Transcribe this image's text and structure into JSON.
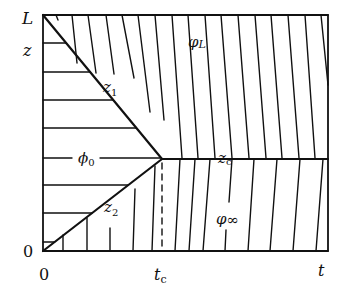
{
  "diagram": {
    "stroke_color": "#111111",
    "background": "#ffffff",
    "frame": {
      "x0": 43,
      "y0": 15,
      "x1": 328,
      "y1": 251
    },
    "junction": {
      "x": 162,
      "y": 159
    },
    "labels": {
      "L": "L",
      "z": "z",
      "z1": "z",
      "z1_sub": "1",
      "z2": "z",
      "z2_sub": "2",
      "zc": "z",
      "zc_sub": "c",
      "phi0": "ϕ",
      "phi0_sub": "0",
      "phiL": "φ",
      "phiL_sub": "L",
      "phiInf": "φ",
      "phiInf_sub": "∞",
      "origin_z": "0",
      "origin_t": "0",
      "tc": "t",
      "tc_sub": "c",
      "t": "t"
    },
    "left_top_hlines_y": [
      43,
      72,
      100,
      128
    ],
    "phi0_line_y": 158,
    "left_bottom_hlines_y": [
      185,
      213,
      242
    ],
    "top_region_lines": [
      [
        56,
        15,
        58,
        20
      ],
      [
        72,
        15,
        77,
        63
      ],
      [
        88,
        15,
        96,
        73
      ],
      [
        106,
        15,
        114,
        74
      ],
      [
        122,
        15,
        134,
        78
      ],
      [
        138,
        15,
        150,
        112
      ],
      [
        155,
        15,
        164,
        120
      ],
      [
        172,
        15,
        182,
        158
      ],
      [
        188,
        15,
        198,
        158
      ],
      [
        205,
        15,
        215,
        158
      ],
      [
        221,
        15,
        232,
        158
      ],
      [
        238,
        15,
        249,
        158
      ],
      [
        255,
        15,
        266,
        158
      ],
      [
        271,
        15,
        282,
        158
      ],
      [
        288,
        15,
        299,
        158
      ],
      [
        305,
        15,
        315,
        158
      ],
      [
        321,
        15,
        328,
        85
      ]
    ],
    "bottom_region_lines": [
      [
        180,
        159,
        175,
        251
      ],
      [
        195,
        159,
        189,
        251
      ],
      [
        210,
        159,
        203,
        251
      ],
      [
        254,
        159,
        248,
        251
      ],
      [
        277,
        159,
        270,
        251
      ],
      [
        300,
        159,
        293,
        251
      ],
      [
        323,
        159,
        316,
        251
      ]
    ],
    "lower_left_vlines": [
      [
        63,
        235,
        63,
        251
      ],
      [
        87,
        218,
        87,
        251
      ],
      [
        110,
        228,
        110,
        251
      ],
      [
        135,
        189,
        133,
        251
      ],
      [
        155,
        166,
        152,
        251
      ]
    ]
  }
}
